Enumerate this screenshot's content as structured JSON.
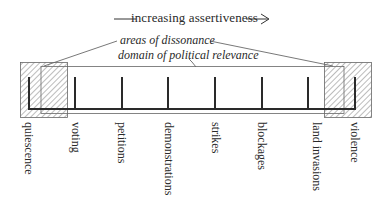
{
  "diagram": {
    "title": "increasing assertiveness",
    "annotations": {
      "dissonance": "areas of dissonance",
      "domain": "domain of political relevance"
    },
    "scale": [
      {
        "label": "quiescence",
        "x": 28
      },
      {
        "label": "voting",
        "x": 75
      },
      {
        "label": "petitions",
        "x": 122
      },
      {
        "label": "demonstrations",
        "x": 168
      },
      {
        "label": "strikes",
        "x": 215
      },
      {
        "label": "blockages",
        "x": 262
      },
      {
        "label": "land invasions",
        "x": 308
      },
      {
        "label": "violence",
        "x": 355
      }
    ],
    "colors": {
      "line": "#2a2a2a",
      "thin": "#555555",
      "hatch": "#777777"
    }
  }
}
